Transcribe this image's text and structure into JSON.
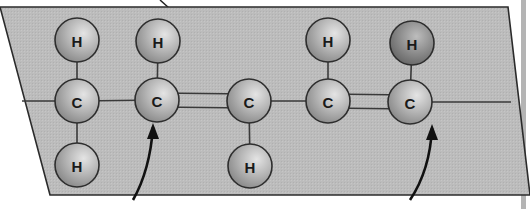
{
  "diagram": {
    "title": "",
    "colors": {
      "plane": "#b9b9b9",
      "plane_stroke": "#2b2b2b",
      "atom_fill_light": "#d6d6d6",
      "atom_fill_dark": "#8e8e8e",
      "hydrogen_dark_fill": "#7a7a7a",
      "bond": "#3a3a3a",
      "arrow": "#111111",
      "right_bar": "#b4b4b4"
    },
    "atoms": [
      {
        "id": "H1",
        "label": "H",
        "x": 77,
        "y": 40,
        "r": 22
      },
      {
        "id": "H2",
        "label": "H",
        "x": 158,
        "y": 41,
        "r": 22
      },
      {
        "id": "H3",
        "label": "H",
        "x": 328,
        "y": 40,
        "r": 22
      },
      {
        "id": "H4",
        "label": "H",
        "x": 412,
        "y": 43,
        "r": 22,
        "shade": "dark"
      },
      {
        "id": "C1",
        "label": "C",
        "x": 77,
        "y": 101,
        "r": 22
      },
      {
        "id": "C2",
        "label": "C",
        "x": 157,
        "y": 100,
        "r": 22
      },
      {
        "id": "C3",
        "label": "C",
        "x": 249,
        "y": 101,
        "r": 22
      },
      {
        "id": "C4",
        "label": "C",
        "x": 328,
        "y": 101,
        "r": 22
      },
      {
        "id": "C5",
        "label": "C",
        "x": 410,
        "y": 102,
        "r": 22
      },
      {
        "id": "H5",
        "label": "H",
        "x": 77,
        "y": 165,
        "r": 22
      },
      {
        "id": "H6",
        "label": "H",
        "x": 250,
        "y": 166,
        "r": 22
      }
    ],
    "bonds": [
      {
        "from": "H1",
        "to": "C1",
        "order": 1
      },
      {
        "from": "H2",
        "to": "C2",
        "order": 1
      },
      {
        "from": "H3",
        "to": "C4",
        "order": 1
      },
      {
        "from": "H4",
        "to": "C5",
        "order": 1
      },
      {
        "from": "C1",
        "to": "H5",
        "order": 1
      },
      {
        "from": "C3",
        "to": "H6",
        "order": 1
      },
      {
        "from": "C1",
        "to": "C2",
        "order": 1
      },
      {
        "from": "C2",
        "to": "C3",
        "order": 2
      },
      {
        "from": "C3",
        "to": "C4",
        "order": 1
      },
      {
        "from": "C4",
        "to": "C5",
        "order": 2
      }
    ],
    "arrows": [
      {
        "name": "arrow-to-c2",
        "path": "M133 200 Q 150 170 153 127",
        "tip": [
          153,
          123
        ]
      },
      {
        "name": "arrow-to-c5",
        "path": "M410 200 Q 430 170 432 128",
        "tip": [
          432,
          124
        ]
      }
    ]
  }
}
